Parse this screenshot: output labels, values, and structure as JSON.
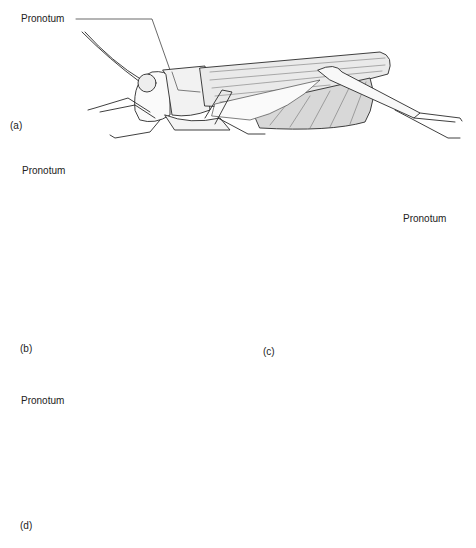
{
  "figure": {
    "panels": [
      {
        "id": "a",
        "letter": "(a)",
        "label": "Pronotum",
        "insect": "grasshopper"
      },
      {
        "id": "b",
        "letter": "(b)",
        "label": "Pronotum",
        "insect": "cockroach"
      },
      {
        "id": "c",
        "letter": "(c)",
        "label": "Pronotum",
        "insect": "treehopper"
      },
      {
        "id": "d",
        "letter": "(d)",
        "label": "Pronotum",
        "insect": "rhinoceros beetle"
      }
    ]
  },
  "colors": {
    "line": "#2a2a2a",
    "fill": "#f4f4f4",
    "background": "#ffffff"
  }
}
